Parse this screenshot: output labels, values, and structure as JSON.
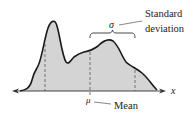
{
  "diagram": {
    "type": "distribution-curve",
    "labels": {
      "sigma": "σ",
      "std_line1": "Standard",
      "std_line2": "deviation",
      "mu": "μ",
      "mean": "Mean",
      "x_axis": "x"
    },
    "colors": {
      "fill": "#d4d4d4",
      "curve": "#1a1a1a",
      "axis": "#333333",
      "dashed": "#555555"
    }
  }
}
